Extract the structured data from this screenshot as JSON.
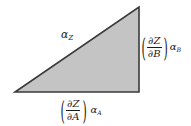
{
  "figure": {
    "name": "right-triangle-partial-derivative-diagram",
    "background_color": "#ffffff",
    "triangle": {
      "fill_color": "#c4c4c4",
      "stroke_color": "#3a3a3a",
      "stroke_width": 1.6,
      "vertices": {
        "apex": [
          139,
          7
        ],
        "bottom_right": [
          139,
          92
        ],
        "bottom_left": [
          15,
          92
        ]
      },
      "points_attr": "139,7 139,92 15,92"
    },
    "labels": {
      "hypotenuse": {
        "symbol": "α",
        "subscript": "Z",
        "full_text": "αZ"
      },
      "vertical_leg": {
        "open_paren": "(",
        "numerator": "∂Z",
        "denominator": "∂B",
        "close_paren": ")",
        "coefficient_symbol": "α",
        "coefficient_subscript": "B",
        "full_text": "(∂Z/∂B) αB"
      },
      "horizontal_leg": {
        "open_paren": "(",
        "numerator": "∂Z",
        "denominator": "∂A",
        "close_paren": ")",
        "coefficient_symbol": "α",
        "coefficient_subscript": "A",
        "full_text": "(∂Z/∂A) αA"
      }
    }
  }
}
